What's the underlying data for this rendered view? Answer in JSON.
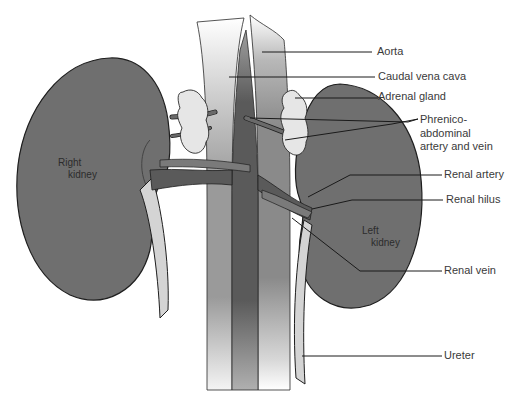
{
  "diagram": {
    "colors": {
      "kidney_fill": "#6f6f6f",
      "vessel_dark": "#5a5a5a",
      "aorta_gradient_top": "#9a9a9a",
      "adrenal_fill": "#e6e6e6",
      "ureter_fill": "#d4d4d4",
      "outline": "#1e1e1e",
      "label_text": "#3a3a3a",
      "background": "#ffffff"
    },
    "organ_labels": {
      "right_kidney": [
        "Right",
        "kidney"
      ],
      "left_kidney": [
        "Left",
        "kidney"
      ]
    },
    "callouts": [
      {
        "id": "aorta",
        "text": "Aorta"
      },
      {
        "id": "caudal_vena_cava",
        "text": "Caudal vena cava"
      },
      {
        "id": "adrenal_gland",
        "text": "Adrenal gland"
      },
      {
        "id": "phrenico",
        "lines": [
          "Phrenico-",
          "abdominal",
          "artery and vein"
        ]
      },
      {
        "id": "renal_artery",
        "text": "Renal artery"
      },
      {
        "id": "renal_hilus",
        "text": "Renal hilus"
      },
      {
        "id": "renal_vein",
        "text": "Renal vein"
      },
      {
        "id": "ureter",
        "text": "Ureter"
      }
    ]
  }
}
